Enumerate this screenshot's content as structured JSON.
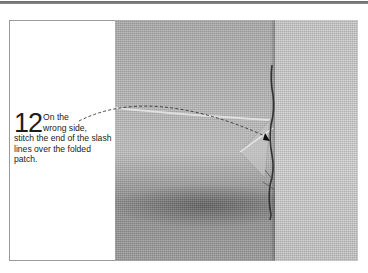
{
  "page": {
    "step": {
      "number": "12",
      "lead": "On the",
      "line2": "wrong side,",
      "rest": "stitch the end of the slash lines over the folded patch."
    },
    "photo": {
      "subject": "fabric-with-folded-patch-and-stitch-line",
      "leader_line": "dashed-arrow"
    },
    "colors": {
      "rule": "#6a6a6a",
      "frame_border": "#9a9a9a",
      "text": "#222222",
      "fabric_mid": "#b4b4b4",
      "fabric_shadow": "#6e6e6e",
      "stitch": "#3a3a3a"
    }
  }
}
